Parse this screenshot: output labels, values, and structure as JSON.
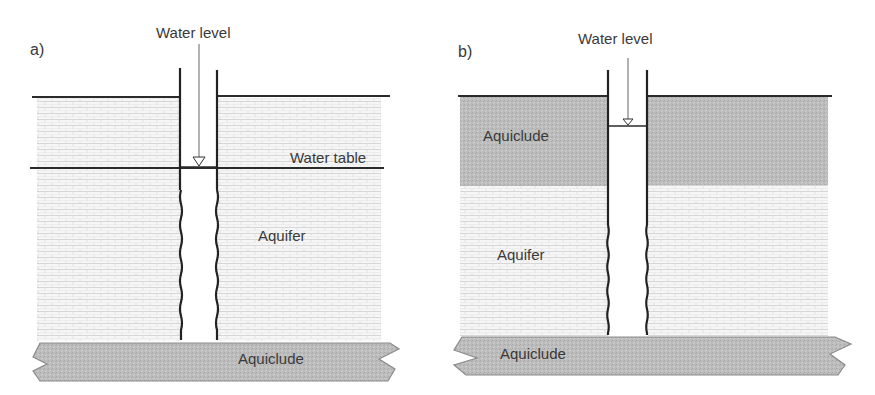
{
  "panels": [
    {
      "id": "a",
      "panel_label": "a)",
      "water_level_label": "Water level",
      "water_table_label": "Water table",
      "aquifer_label": "Aquifer",
      "aquiclude_bottom_label": "Aquiclude",
      "type": "unconfined aquifer"
    },
    {
      "id": "b",
      "panel_label": "b)",
      "water_level_label": "Water level",
      "aquiclude_top_label": "Aquiclude",
      "aquifer_label": "Aquifer",
      "aquiclude_bottom_label": "Aquiclude",
      "type": "confined aquifer"
    }
  ],
  "colors": {
    "aquiclude_fill": "#bdbdbd",
    "aquiclude_stroke": "#8a8a8a",
    "aquifer_fill": "#f4f4f4",
    "aquifer_pattern": "#c8c8c8",
    "line": "#2a2a2a",
    "text": "#3a3a3a"
  }
}
